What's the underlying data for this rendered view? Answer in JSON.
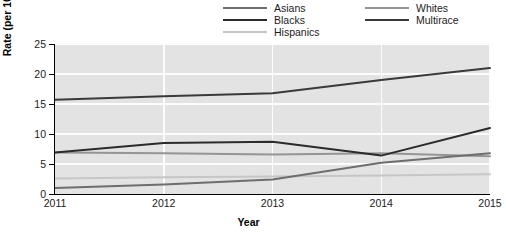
{
  "chart_data": {
    "type": "line",
    "title": "",
    "xlabel": "Year",
    "ylabel": "Rate (per 100,000 population)",
    "x": [
      2011,
      2012,
      2013,
      2014,
      2015
    ],
    "xtick_labels": [
      "2011",
      "2012",
      "2013",
      "2014",
      "2015"
    ],
    "ytick_labels": [
      "0",
      "5",
      "10",
      "15",
      "20",
      "25"
    ],
    "yticks": [
      0,
      5,
      10,
      15,
      20,
      25
    ],
    "ylim": [
      0,
      25
    ],
    "xlim": [
      2011,
      2015
    ],
    "grid": "white gridlines on gray panel",
    "legend_position": "top-center, two columns",
    "series": [
      {
        "name": "Asians",
        "color": "#6e6e6e",
        "values": [
          1.0,
          1.6,
          2.4,
          5.2,
          6.8
        ]
      },
      {
        "name": "Blacks",
        "color": "#2b2b2b",
        "values": [
          6.9,
          8.5,
          8.7,
          6.4,
          11.0
        ]
      },
      {
        "name": "Hispanics",
        "color": "#c6c6c6",
        "values": [
          2.6,
          2.8,
          2.9,
          3.1,
          3.3
        ]
      },
      {
        "name": "Whites",
        "color": "#959595",
        "values": [
          6.9,
          6.8,
          6.6,
          6.8,
          6.3
        ]
      },
      {
        "name": "Multirace",
        "color": "#3a3a3a",
        "values": [
          15.7,
          16.3,
          16.8,
          19.0,
          21.0
        ]
      }
    ],
    "extra_series_note": "A fifth low flat line near 2.9 at 2015 belongs to Hispanics cluster"
  },
  "legend": {
    "items": [
      {
        "label": "Asians",
        "color": "#6e6e6e"
      },
      {
        "label": "Whites",
        "color": "#959595"
      },
      {
        "label": "Blacks",
        "color": "#2b2b2b"
      },
      {
        "label": "Multirace",
        "color": "#3a3a3a"
      },
      {
        "label": "Hispanics",
        "color": "#c6c6c6"
      },
      {
        "label": "",
        "color": "transparent"
      }
    ]
  },
  "axes": {
    "y_title": "Rate (per 100,000 population)",
    "x_title": "Year",
    "y_ticks": [
      "25",
      "20",
      "15",
      "10",
      "5",
      "0"
    ],
    "x_ticks": [
      "2011",
      "2012",
      "2013",
      "2014",
      "2015"
    ]
  },
  "colors": {
    "panel": "#e3e3e3",
    "grid": "#fcfcfc",
    "axis": "#000000",
    "text": "#1a1a1a"
  }
}
